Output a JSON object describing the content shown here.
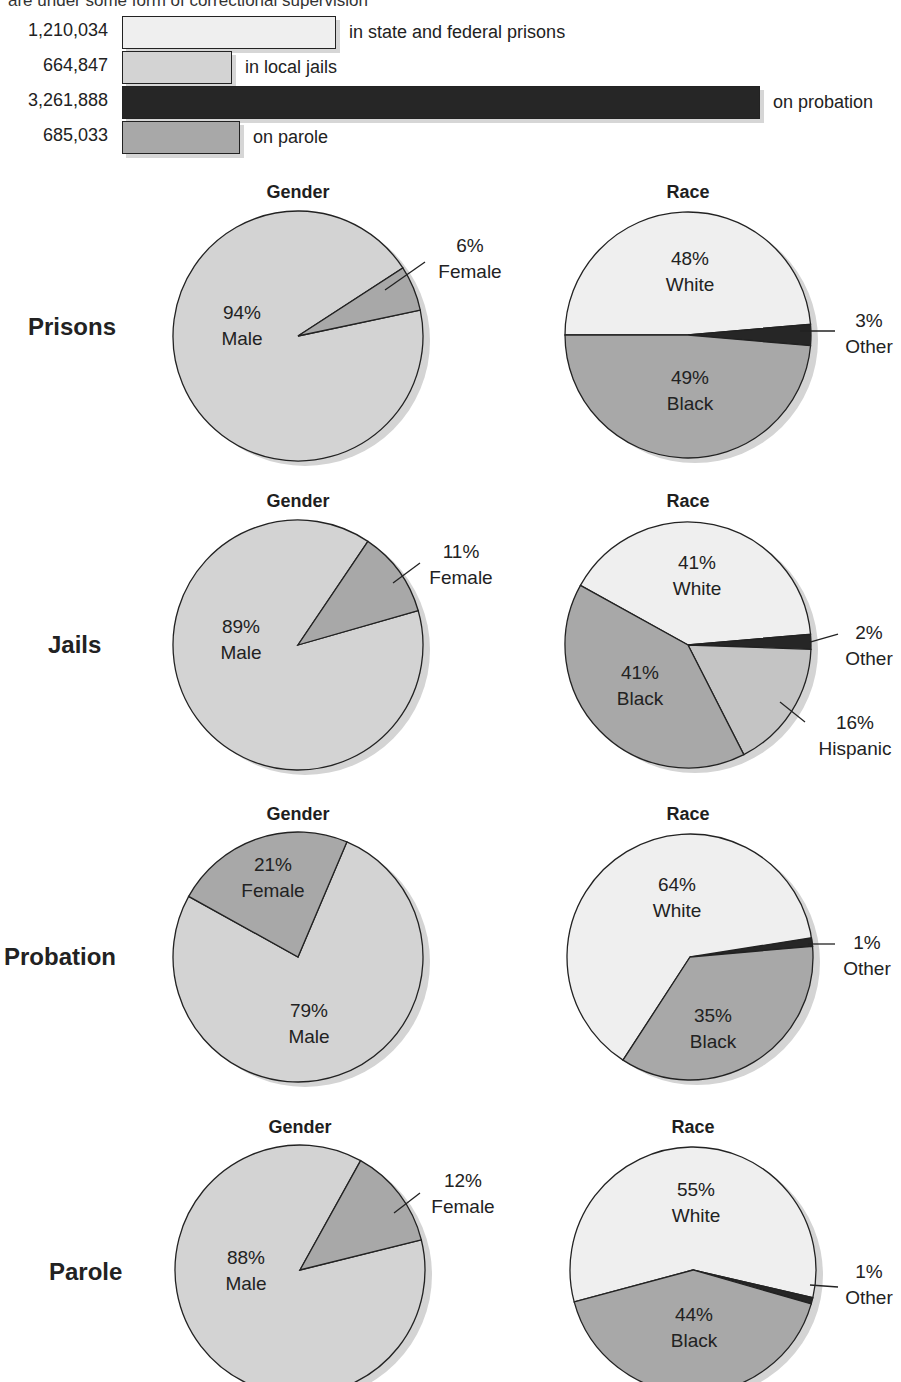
{
  "header": {
    "caption": "are under some form of correctional supervision"
  },
  "colors": {
    "very_light": "#efefef",
    "light": "#d3d3d3",
    "medium": "#a8a8a8",
    "dark": "#262626",
    "outline": "#222222",
    "shadow": "#d4d4d4"
  },
  "bars": [
    {
      "value": "1,210,034",
      "label": "in state and federal prisons",
      "num": 1210034,
      "fill": "#efefef",
      "top": 16,
      "end": 336
    },
    {
      "value": "664,847",
      "label": "in local jails",
      "num": 664847,
      "fill": "#d3d3d3",
      "top": 51,
      "end": 232
    },
    {
      "value": "3,261,888",
      "label": "on probation",
      "num": 3261888,
      "fill": "#262626",
      "top": 86,
      "end": 760
    },
    {
      "value": "685,033",
      "label": "on parole",
      "num": 685033,
      "fill": "#a8a8a8",
      "top": 121,
      "end": 240
    }
  ],
  "rows": [
    {
      "label": "Prisons",
      "label_y": 313,
      "label_x": 28,
      "gender": {
        "title": "Gender",
        "cx": 298,
        "cy": 336,
        "r": 125,
        "slices": [
          {
            "pct": "94%",
            "name": "Male",
            "start": 78,
            "end": 417,
            "fill": "#d3d3d3"
          },
          {
            "pct": "6%",
            "name": "Female",
            "start": 57,
            "end": 78,
            "fill": "#a8a8a8"
          }
        ],
        "labels": [
          {
            "text1": "94%",
            "text2": "Male",
            "x": 242,
            "y": 300
          },
          {
            "text1": "6%",
            "text2": "Female",
            "x": 470,
            "y": 233
          }
        ],
        "leader": {
          "x1": 385,
          "y1": 290,
          "x2": 425,
          "y2": 262
        }
      },
      "race": {
        "title": "Race",
        "cx": 688,
        "cy": 335,
        "r": 123,
        "slices": [
          {
            "pct": "48%",
            "name": "White",
            "start": -90,
            "end": 85,
            "fill": "#efefef"
          },
          {
            "pct": "3%",
            "name": "Other",
            "start": 85,
            "end": 95,
            "fill": "#262626"
          },
          {
            "pct": "49%",
            "name": "Black",
            "start": 95,
            "end": 270,
            "fill": "#a8a8a8"
          }
        ],
        "labels": [
          {
            "text1": "48%",
            "text2": "White",
            "x": 690,
            "y": 246
          },
          {
            "text1": "3%",
            "text2": "Other",
            "x": 869,
            "y": 308
          },
          {
            "text1": "49%",
            "text2": "Black",
            "x": 690,
            "y": 365
          }
        ],
        "leader": {
          "x1": 800,
          "y1": 331,
          "x2": 835,
          "y2": 331
        }
      }
    },
    {
      "label": "Jails",
      "label_y": 631,
      "label_x": 48,
      "gender": {
        "title": "Gender",
        "cx": 298,
        "cy": 645,
        "r": 125,
        "slices": [
          {
            "pct": "89%",
            "name": "Male",
            "start": 74,
            "end": 394,
            "fill": "#d3d3d3"
          },
          {
            "pct": "11%",
            "name": "Female",
            "start": 34,
            "end": 74,
            "fill": "#a8a8a8"
          }
        ],
        "labels": [
          {
            "text1": "89%",
            "text2": "Male",
            "x": 241,
            "y": 614
          },
          {
            "text1": "11%",
            "text2": "Female",
            "x": 461,
            "y": 539
          }
        ],
        "leader": {
          "x1": 393,
          "y1": 583,
          "x2": 420,
          "y2": 563
        }
      },
      "race": {
        "title": "Race",
        "cx": 688,
        "cy": 645,
        "r": 123,
        "slices": [
          {
            "pct": "41%",
            "name": "White",
            "start": -61,
            "end": 85,
            "fill": "#efefef"
          },
          {
            "pct": "2%",
            "name": "Other",
            "start": 85,
            "end": 92,
            "fill": "#262626"
          },
          {
            "pct": "16%",
            "name": "Hispanic",
            "start": 92,
            "end": 153,
            "fill": "#c4c4c4"
          },
          {
            "pct": "41%",
            "name": "Black",
            "start": 153,
            "end": 299,
            "fill": "#a8a8a8"
          }
        ],
        "labels": [
          {
            "text1": "41%",
            "text2": "White",
            "x": 697,
            "y": 550
          },
          {
            "text1": "2%",
            "text2": "Other",
            "x": 869,
            "y": 620
          },
          {
            "text1": "16%",
            "text2": "Hispanic",
            "x": 855,
            "y": 710
          },
          {
            "text1": "41%",
            "text2": "Black",
            "x": 640,
            "y": 660
          }
        ],
        "leaders": [
          {
            "x1": 810,
            "y1": 642,
            "x2": 838,
            "y2": 634
          },
          {
            "x1": 780,
            "y1": 702,
            "x2": 805,
            "y2": 722
          }
        ]
      }
    },
    {
      "label": "Probation",
      "label_y": 943,
      "label_x": 4,
      "gender": {
        "title": "Gender",
        "cx": 298,
        "cy": 957,
        "r": 125,
        "slices": [
          {
            "pct": "79%",
            "name": "Male",
            "start": 23,
            "end": 299,
            "fill": "#d3d3d3"
          },
          {
            "pct": "21%",
            "name": "Female",
            "start": -61,
            "end": 23,
            "fill": "#a8a8a8"
          }
        ],
        "labels": [
          {
            "text1": "21%",
            "text2": "Female",
            "x": 273,
            "y": 852
          },
          {
            "text1": "79%",
            "text2": "Male",
            "x": 309,
            "y": 998
          }
        ]
      },
      "race": {
        "title": "Race",
        "cx": 690,
        "cy": 957,
        "r": 123,
        "slices": [
          {
            "pct": "64%",
            "name": "White",
            "start": 213,
            "end": 445,
            "fill": "#efefef"
          },
          {
            "pct": "1%",
            "name": "Other",
            "start": 81,
            "end": 85,
            "fill": "#262626"
          },
          {
            "pct": "35%",
            "name": "Black",
            "start": 85,
            "end": 213,
            "fill": "#a8a8a8"
          }
        ],
        "labels": [
          {
            "text1": "64%",
            "text2": "White",
            "x": 677,
            "y": 872
          },
          {
            "text1": "1%",
            "text2": "Other",
            "x": 867,
            "y": 930
          },
          {
            "text1": "35%",
            "text2": "Black",
            "x": 713,
            "y": 1003
          }
        ],
        "leader": {
          "x1": 808,
          "y1": 944,
          "x2": 835,
          "y2": 944
        }
      }
    },
    {
      "label": "Parole",
      "label_y": 1258,
      "label_x": 49,
      "gender": {
        "title": "Gender",
        "cx": 300,
        "cy": 1270,
        "r": 125,
        "slices": [
          {
            "pct": "88%",
            "name": "Male",
            "start": 76,
            "end": 389,
            "fill": "#d3d3d3"
          },
          {
            "pct": "12%",
            "name": "Female",
            "start": 29,
            "end": 76,
            "fill": "#a8a8a8"
          }
        ],
        "labels": [
          {
            "text1": "88%",
            "text2": "Male",
            "x": 246,
            "y": 1245
          },
          {
            "text1": "12%",
            "text2": "Female",
            "x": 463,
            "y": 1168
          }
        ],
        "leader": {
          "x1": 394,
          "y1": 1213,
          "x2": 420,
          "y2": 1193
        }
      },
      "race": {
        "title": "Race",
        "cx": 693,
        "cy": 1270,
        "r": 123,
        "slices": [
          {
            "pct": "55%",
            "name": "White",
            "start": 255,
            "end": 463,
            "fill": "#efefef"
          },
          {
            "pct": "1%",
            "name": "Other",
            "start": 103,
            "end": 106,
            "fill": "#262626"
          },
          {
            "pct": "44%",
            "name": "Black",
            "start": 106,
            "end": 255,
            "fill": "#a8a8a8"
          }
        ],
        "labels": [
          {
            "text1": "55%",
            "text2": "White",
            "x": 696,
            "y": 1177
          },
          {
            "text1": "1%",
            "text2": "Other",
            "x": 869,
            "y": 1259
          },
          {
            "text1": "44%",
            "text2": "Black",
            "x": 694,
            "y": 1302
          }
        ],
        "leader": {
          "x1": 810,
          "y1": 1285,
          "x2": 838,
          "y2": 1287
        }
      }
    }
  ],
  "chart_data": [
    {
      "type": "bar",
      "title": "are under some form of correctional supervision",
      "orientation": "horizontal",
      "categories": [
        "in state and federal prisons",
        "in local jails",
        "on probation",
        "on parole"
      ],
      "values": [
        1210034,
        664847,
        3261888,
        685033
      ],
      "value_labels": [
        "1,210,034",
        "664,847",
        "3,261,888",
        "685,033"
      ],
      "xlabel": "",
      "ylabel": "",
      "grid": false
    },
    {
      "type": "pie",
      "title": "Prisons — Gender",
      "categories": [
        "Male",
        "Female"
      ],
      "values": [
        94,
        6
      ]
    },
    {
      "type": "pie",
      "title": "Prisons — Race",
      "categories": [
        "White",
        "Other",
        "Black"
      ],
      "values": [
        48,
        3,
        49
      ]
    },
    {
      "type": "pie",
      "title": "Jails — Gender",
      "categories": [
        "Male",
        "Female"
      ],
      "values": [
        89,
        11
      ]
    },
    {
      "type": "pie",
      "title": "Jails — Race",
      "categories": [
        "White",
        "Other",
        "Hispanic",
        "Black"
      ],
      "values": [
        41,
        2,
        16,
        41
      ]
    },
    {
      "type": "pie",
      "title": "Probation — Gender",
      "categories": [
        "Male",
        "Female"
      ],
      "values": [
        79,
        21
      ]
    },
    {
      "type": "pie",
      "title": "Probation — Race",
      "categories": [
        "White",
        "Other",
        "Black"
      ],
      "values": [
        64,
        1,
        35
      ]
    },
    {
      "type": "pie",
      "title": "Parole — Gender",
      "categories": [
        "Male",
        "Female"
      ],
      "values": [
        88,
        12
      ]
    },
    {
      "type": "pie",
      "title": "Parole — Race",
      "categories": [
        "White",
        "Other",
        "Black"
      ],
      "values": [
        55,
        1,
        44
      ]
    }
  ]
}
